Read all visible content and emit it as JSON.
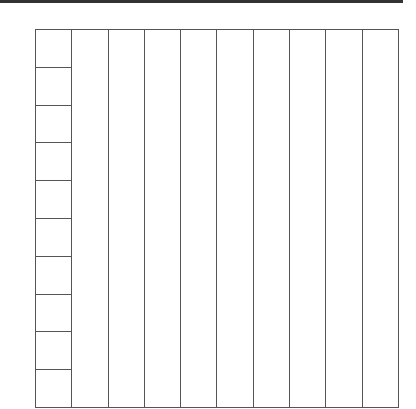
{
  "diagram": {
    "type": "place-value-grid",
    "columns": 10,
    "first_column_rows": 10,
    "line_color": "#555555",
    "rule_color": "#333333"
  }
}
